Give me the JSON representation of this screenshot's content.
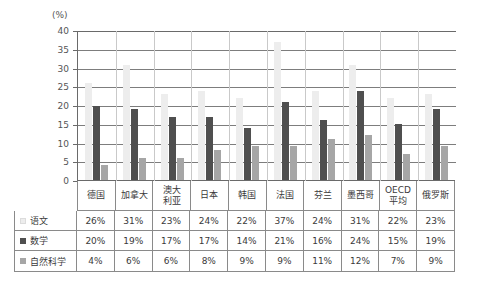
{
  "chart_data": {
    "type": "bar",
    "title": "",
    "xlabel": "",
    "ylabel": "(%)",
    "ylim": [
      0,
      40
    ],
    "yticks": [
      40,
      35,
      30,
      25,
      20,
      15,
      10,
      5,
      0
    ],
    "grid": true,
    "legend_position": "left-table",
    "categories": [
      "德国",
      "加拿大",
      "澳大\n利亚",
      "日本",
      "韩国",
      "法国",
      "芬兰",
      "墨西哥",
      "OECD\n平均",
      "俄罗斯"
    ],
    "series": [
      {
        "name": "语文",
        "color": "#ededed",
        "values": [
          26,
          31,
          23,
          24,
          22,
          37,
          24,
          31,
          22,
          23
        ],
        "labels": [
          "26%",
          "31%",
          "23%",
          "24%",
          "22%",
          "37%",
          "24%",
          "31%",
          "22%",
          "23%"
        ]
      },
      {
        "name": "数学",
        "color": "#4f4f4f",
        "values": [
          20,
          19,
          17,
          17,
          14,
          21,
          16,
          24,
          15,
          19
        ],
        "labels": [
          "20%",
          "19%",
          "17%",
          "17%",
          "14%",
          "21%",
          "16%",
          "24%",
          "15%",
          "19%"
        ]
      },
      {
        "name": "自然科学",
        "color": "#a6a6a6",
        "values": [
          4,
          6,
          6,
          8,
          9,
          9,
          11,
          12,
          7,
          9
        ],
        "labels": [
          "4%",
          "6%",
          "6%",
          "8%",
          "9%",
          "9%",
          "11%",
          "12%",
          "7%",
          "9%"
        ]
      }
    ]
  },
  "axis": {
    "unit": "(%)",
    "ticks": [
      "40",
      "35",
      "30",
      "25",
      "20",
      "15",
      "10",
      "5",
      "0"
    ]
  },
  "countries": [
    {
      "line1": "德国",
      "line2": ""
    },
    {
      "line1": "加拿大",
      "line2": ""
    },
    {
      "line1": "澳大",
      "line2": "利亚"
    },
    {
      "line1": "日本",
      "line2": ""
    },
    {
      "line1": "韩国",
      "line2": ""
    },
    {
      "line1": "法国",
      "line2": ""
    },
    {
      "line1": "芬兰",
      "line2": ""
    },
    {
      "line1": "墨西哥",
      "line2": ""
    },
    {
      "line1": "OECD",
      "line2": "平均"
    },
    {
      "line1": "俄罗斯",
      "line2": ""
    }
  ],
  "table": {
    "rows": [
      {
        "label": "语文",
        "swatch": "s0",
        "values": [
          "26%",
          "31%",
          "23%",
          "24%",
          "22%",
          "37%",
          "24%",
          "31%",
          "22%",
          "23%"
        ]
      },
      {
        "label": "数学",
        "swatch": "s1",
        "values": [
          "20%",
          "19%",
          "17%",
          "17%",
          "14%",
          "21%",
          "16%",
          "24%",
          "15%",
          "19%"
        ]
      },
      {
        "label": "自然科学",
        "swatch": "s2",
        "values": [
          "4%",
          "6%",
          "6%",
          "8%",
          "9%",
          "9%",
          "11%",
          "12%",
          "7%",
          "9%"
        ]
      }
    ]
  }
}
